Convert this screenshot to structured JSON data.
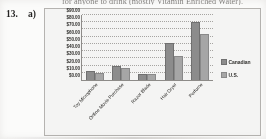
{
  "page": {
    "question_number": "13.",
    "part_label": "a)",
    "cut_off_text": "for anyone to drink (mostly Vitamin Enriched Water)."
  },
  "chart_data": {
    "type": "bar",
    "title": "",
    "xlabel": "",
    "ylabel": "",
    "categories": [
      "Toy Microphone",
      "Online Movie Purchase",
      "Razor Blade",
      "Hair Dryer",
      "Perfume"
    ],
    "series": [
      {
        "name": "Canadian",
        "color": "#8d8d8d",
        "values": [
          12.0,
          19.0,
          9.0,
          51.0,
          80.0
        ]
      },
      {
        "name": "U.S.",
        "color": "#a9a9a9",
        "values": [
          10.0,
          16.0,
          8.0,
          33.0,
          64.0
        ]
      }
    ],
    "ylim": [
      0,
      90
    ],
    "ytick_step": 10,
    "ytick_labels": [
      "$90.00",
      "$80.00",
      "$70.00",
      "$60.00",
      "$50.00",
      "$40.00",
      "$30.00",
      "$20.00",
      "$10.00",
      "$0.00"
    ],
    "grid": true,
    "legend_position": "right"
  }
}
